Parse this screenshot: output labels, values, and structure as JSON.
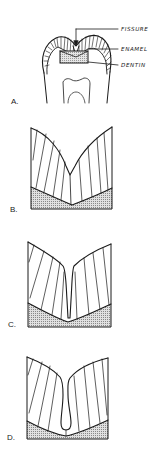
{
  "figure": {
    "panels": [
      {
        "id": "A",
        "label": "A.",
        "description": "Molar tooth cross-section with occlusal fissure",
        "callouts": [
          {
            "text": "FISSURE"
          },
          {
            "text": "ENAMEL"
          },
          {
            "text": "DENTIN"
          }
        ]
      },
      {
        "id": "B",
        "label": "B.",
        "description": "Shallow V-shaped fissure"
      },
      {
        "id": "C",
        "label": "C.",
        "description": "Narrow deep slit fissure"
      },
      {
        "id": "D",
        "label": "D.",
        "description": "Bulbous / inverted-Y fissure"
      }
    ],
    "colors": {
      "line": "#1a1a1a",
      "dentin_fill": "#d9d9d9",
      "background": "#ffffff"
    }
  }
}
